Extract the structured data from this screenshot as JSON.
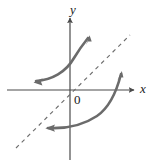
{
  "figure": {
    "kind": "math-graph",
    "caption_text": "",
    "background_color": "#ffffff",
    "width": 153,
    "height": 163
  },
  "axes": {
    "x_label": "x",
    "y_label": "y",
    "origin_label": "0",
    "axis_color": "#4a4a4a",
    "x_axis": {
      "x1": 7,
      "y1": 90,
      "x2": 134,
      "y2": 90
    },
    "y_axis": {
      "x1": 70,
      "y1": 160,
      "x2": 70,
      "y2": 18
    },
    "origin": {
      "x": 70,
      "y": 90
    }
  },
  "reference_line": {
    "name": "y = x",
    "style": "dashed",
    "color": "#6e6e6e",
    "dash_pattern": "4 4",
    "x1": 16,
    "y1": 148,
    "x2": 130,
    "y2": 35
  },
  "curves": [
    {
      "name": "exponential-curve",
      "description": "increasing curve in upper region with arrowheads at both ends",
      "color": "#6b6b6b",
      "stroke_width": 2.6,
      "path": "M 36 81 C 52 80, 66 72, 74 58 C 80 48, 84 43, 88 38",
      "arrow_start": {
        "x": 36,
        "y": 81,
        "angle": 196
      },
      "arrow_end": {
        "x": 88,
        "y": 38,
        "angle": -53
      }
    },
    {
      "name": "logarithmic-curve",
      "description": "inverse curve in lower-right region, reflection of the exponential curve across y = x, arrowheads at both ends",
      "color": "#6b6b6b",
      "stroke_width": 2.6,
      "path": "M 48 128 C 66 129, 82 126, 97 116 C 110 107, 117 90, 121 74",
      "arrow_start": {
        "x": 48,
        "y": 128,
        "angle": 183
      },
      "arrow_end": {
        "x": 121,
        "y": 74,
        "angle": -75
      }
    }
  ]
}
